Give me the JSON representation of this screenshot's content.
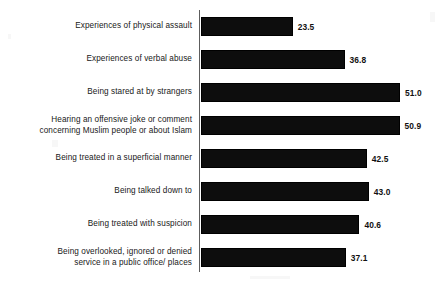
{
  "chart_data": {
    "type": "bar",
    "orientation": "horizontal",
    "title": "",
    "subtitle": "",
    "xlabel": "",
    "ylabel": "",
    "xlim": [
      0,
      51.0
    ],
    "grid": false,
    "legend": null,
    "value_label_format": "one-decimal",
    "categories": [
      "Experiences of physical assault",
      "Experiences of verbal abuse",
      "Being stared at by strangers",
      "Hearing an offensive joke or comment\nconcerning Muslim people or about Islam",
      "Being treated in a superficial manner",
      "Being talked down to",
      "Being treated with suspicion",
      "Being overlooked, ignored or denied\nservice in a public office/ places"
    ],
    "values": [
      23.5,
      36.8,
      51.0,
      50.9,
      42.5,
      43.0,
      40.6,
      37.1
    ],
    "value_labels": [
      "23.5",
      "36.8",
      "51.0",
      "50.9",
      "42.5",
      "43.0",
      "40.6",
      "37.1"
    ],
    "colors": {
      "bar": "#0d0d0d",
      "background": "#ffffff",
      "axis": "#5d5d5d",
      "label_text": "#202020",
      "value_text": "#111111"
    }
  }
}
